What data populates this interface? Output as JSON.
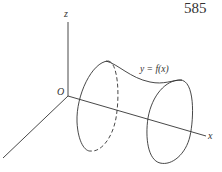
{
  "page": {
    "number": "585"
  },
  "figure": {
    "axes": {
      "z_label": "z",
      "x_label": "x",
      "origin_label": "O"
    },
    "curve_label": "y = f(x)",
    "colors": {
      "stroke": "#333333",
      "background": "#ffffff"
    }
  }
}
